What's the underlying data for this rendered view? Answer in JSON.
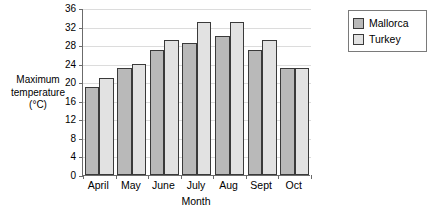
{
  "chart_data": {
    "type": "bar",
    "title": "",
    "xlabel": "Month",
    "ylabel": "Maximum temperature (°C)",
    "ylabel_lines": [
      "Maximum",
      "temperature",
      "(°C)"
    ],
    "categories": [
      "April",
      "May",
      "June",
      "July",
      "Aug",
      "Sept",
      "Oct"
    ],
    "series": [
      {
        "name": "Mallorca",
        "color": "#b9b9b9",
        "values": [
          19,
          23,
          27,
          28.5,
          30,
          27,
          23
        ]
      },
      {
        "name": "Turkey",
        "color": "#e2e2e2",
        "values": [
          21,
          24,
          29,
          33,
          33,
          29,
          23
        ]
      }
    ],
    "ylim": [
      0,
      36
    ],
    "ytick_step": 4,
    "ytick_labels": [
      "0",
      "4",
      "8",
      "12",
      "16",
      "20",
      "24",
      "28",
      "32",
      "36"
    ],
    "grid": true,
    "legend_position": "right-top"
  },
  "legend": {
    "entries": [
      {
        "label": "Mallorca",
        "swatch": "mallorca-swatch"
      },
      {
        "label": "Turkey",
        "swatch": "turkey-swatch"
      }
    ]
  },
  "colors": {
    "mallorca": "#b9b9b9",
    "turkey": "#e2e2e2",
    "bar_outline": "#3a3a3a",
    "axis": "#6b6b6b",
    "gridline": "#dcdcdc",
    "background": "#ffffff"
  }
}
